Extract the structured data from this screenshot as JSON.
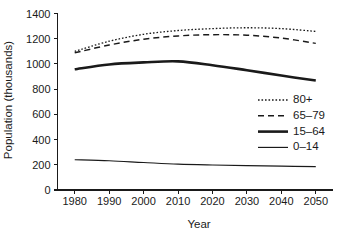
{
  "chart_data": {
    "type": "line",
    "title": "",
    "xlabel": "Year",
    "ylabel": "Population (thousands)",
    "x": [
      1980,
      1990,
      2000,
      2010,
      2020,
      2030,
      2040,
      2050
    ],
    "xlim": [
      1975,
      2055
    ],
    "ylim": [
      0,
      1400
    ],
    "xticks": [
      1980,
      1990,
      2000,
      2010,
      2020,
      2030,
      2040,
      2050
    ],
    "yticks": [
      0,
      200,
      400,
      600,
      800,
      1000,
      1200,
      1400
    ],
    "xtick_labels": [
      "1980",
      "1990",
      "2000",
      "2010",
      "2020",
      "2030",
      "2040",
      "2050"
    ],
    "ytick_labels": [
      "0",
      "200",
      "400",
      "600",
      "800",
      "1000",
      "1200",
      "1400"
    ],
    "grid": false,
    "legend_position": "center-right",
    "series": [
      {
        "name": "80+",
        "style": "dotted",
        "stroke_width": 1.3,
        "dasharray": "1.6 1.9",
        "values": [
          1100,
          1180,
          1235,
          1265,
          1280,
          1287,
          1280,
          1258
        ]
      },
      {
        "name": "65–79",
        "style": "dashed",
        "stroke_width": 1.45,
        "dasharray": "6 4",
        "values": [
          1088,
          1150,
          1196,
          1222,
          1232,
          1228,
          1205,
          1163
        ]
      },
      {
        "name": "15–64",
        "style": "solid-thick",
        "stroke_width": 2.6,
        "dasharray": "",
        "values": [
          958,
          996,
          1012,
          1020,
          990,
          950,
          908,
          868
        ]
      },
      {
        "name": "0–14",
        "style": "solid-thin",
        "stroke_width": 1.15,
        "dasharray": "",
        "values": [
          240,
          232,
          218,
          205,
          198,
          193,
          189,
          185
        ]
      }
    ]
  },
  "legend": {
    "entries": [
      {
        "label": "80+"
      },
      {
        "label": "65–79"
      },
      {
        "label": "15–64"
      },
      {
        "label": "0–14"
      }
    ]
  }
}
